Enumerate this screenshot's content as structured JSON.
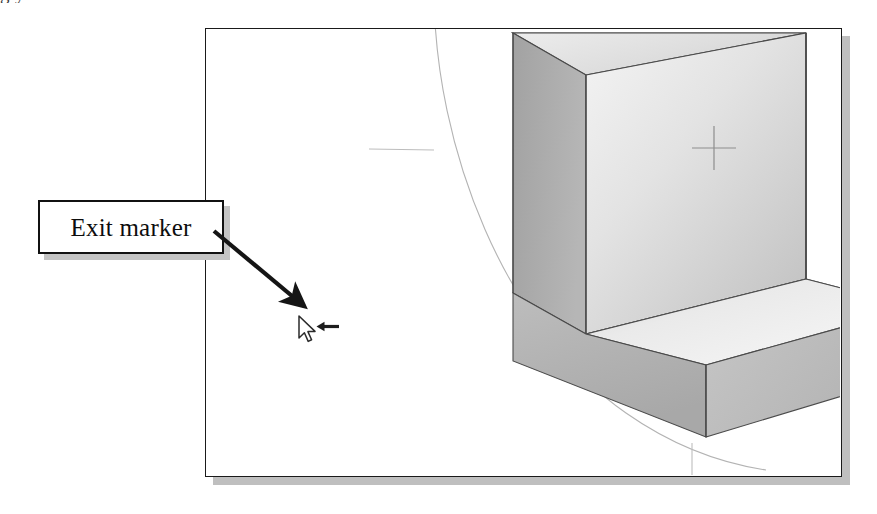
{
  "page": {
    "cut_off_text_above": "g                                    y",
    "background_color": "#ffffff"
  },
  "viewport": {
    "name": "cad-drawing-viewport",
    "border_color": "#1a1a1a",
    "fill_color": "#ffffff",
    "shadow_color": "#bfbfbf",
    "frame": {
      "x": 205,
      "y": 28,
      "width": 637,
      "height": 449
    }
  },
  "model": {
    "name": "l-shaped-block",
    "description": "Isometric L-shaped solid block",
    "face_colors": {
      "top_face": "#e2e2e2",
      "front_face_light": "#f2f2f2",
      "front_face_dark": "#c9c9c9",
      "left_face": "#a9a9a9",
      "bottom_front_face": "#b4b4b4",
      "inner_shelf": "#e8e8e8",
      "edge_color": "#4a4a4a"
    }
  },
  "construction_arc": {
    "name": "construction-arc",
    "color": "#b0b0b0",
    "description": "Faint circular construction arc"
  },
  "center_marker": {
    "name": "center-crosshair-marker",
    "color": "#8d8d8d",
    "x": 713,
    "y": 147,
    "size": 44
  },
  "annotation": {
    "label": "Exit marker",
    "box_border_color": "#111111",
    "box_fill_color": "#ffffff",
    "box_shadow_color": "#c4c4c4",
    "arrow_color": "#151515"
  },
  "cursor": {
    "name": "mouse-pointer",
    "color": "#2b2b2b",
    "x": 303,
    "y": 325
  },
  "exit_marker_glyph": {
    "name": "exit-marker-left-arrow",
    "color": "#1d1d1d",
    "direction": "left"
  }
}
